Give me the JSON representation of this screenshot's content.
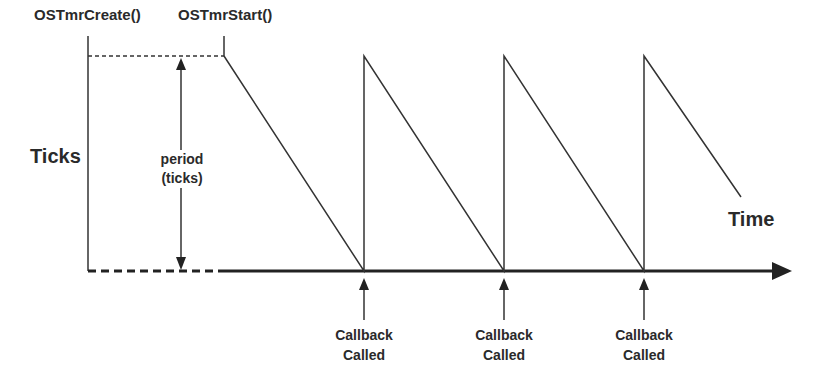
{
  "diagram": {
    "labels": {
      "create": "OSTmrCreate()",
      "start": "OSTmrStart()",
      "y_axis": "Ticks",
      "period_line1": "period",
      "period_line2": "(ticks)",
      "x_axis": "Time"
    },
    "callbacks": [
      {
        "line1": "Callback",
        "line2": "Called",
        "x": 364
      },
      {
        "line1": "Callback",
        "line2": "Called",
        "x": 504
      },
      {
        "line1": "Callback",
        "line2": "Called",
        "x": 644
      }
    ],
    "colors": {
      "line": "#333333",
      "text": "#2a2a2a",
      "background": "#ffffff"
    }
  }
}
